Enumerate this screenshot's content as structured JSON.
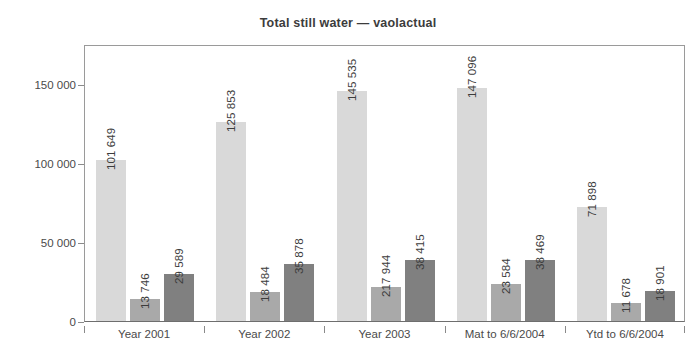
{
  "chart_data": {
    "type": "bar",
    "title": "Total still water — vaolactual",
    "xlabel": "",
    "ylabel": "",
    "ylim": [
      0,
      175000
    ],
    "grid": false,
    "legend": "none",
    "y_ticks": [
      0,
      50000,
      100000,
      150000
    ],
    "y_tick_labels": [
      "0",
      "50 000",
      "100 000",
      "150 000"
    ],
    "categories": [
      "Year 2001",
      "Year 2002",
      "Year 2003",
      "Mat to 6/6/2004",
      "Ytd to 6/6/2004"
    ],
    "series": [
      {
        "name": "series-1",
        "color": "#d9d9d9",
        "values": [
          101649,
          125853,
          145535,
          147096,
          71898
        ],
        "labels": [
          "101 649",
          "125 853",
          "145 535",
          "147 096",
          "71 898"
        ]
      },
      {
        "name": "series-2",
        "color": "#a9a9a9",
        "values": [
          13746,
          18484,
          21794,
          23584,
          11678
        ],
        "labels": [
          "13 746",
          "18 484",
          "217 944",
          "23 584",
          "11 678"
        ]
      },
      {
        "name": "series-3",
        "color": "#808080",
        "values": [
          29589,
          35878,
          38415,
          38469,
          18901
        ],
        "labels": [
          "29 589",
          "35 878",
          "38 415",
          "38 469",
          "18 901"
        ]
      }
    ]
  },
  "colors": {
    "series_light": "#d9d9d9",
    "series_medium": "#a9a9a9",
    "series_dark": "#808080",
    "axis": "#8a8a8a",
    "text": "#3c3c3c",
    "background": "#ffffff"
  }
}
